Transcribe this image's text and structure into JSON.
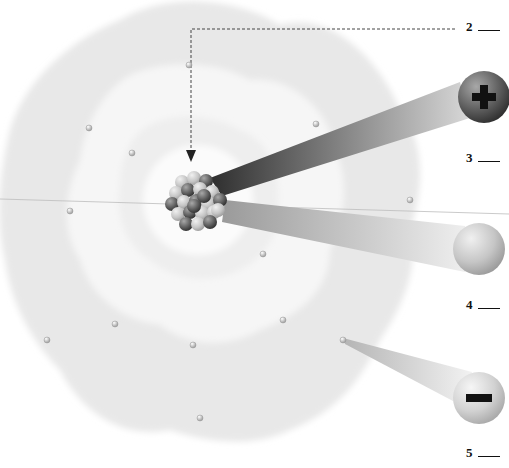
{
  "diagram": {
    "type": "atom-structure",
    "labels": [
      {
        "id": "2",
        "text": "2",
        "blank": "___",
        "target": "nucleus",
        "x": 469,
        "y": 22
      },
      {
        "id": "3",
        "text": "3",
        "blank": "___",
        "target": "proton",
        "x": 469,
        "y": 152
      },
      {
        "id": "4",
        "text": "4",
        "blank": "___",
        "target": "neutron",
        "x": 469,
        "y": 299
      },
      {
        "id": "5",
        "text": "5",
        "blank": "___",
        "target": "electron",
        "x": 469,
        "y": 448
      }
    ],
    "particles": {
      "proton": {
        "symbol": "+",
        "color": "#5a5a5a"
      },
      "neutron": {
        "symbol": "",
        "color": "#c4c4c4"
      },
      "electron": {
        "symbol": "−",
        "color": "#d0d0d0"
      }
    },
    "electrons": [
      {
        "x": 189,
        "y": 65
      },
      {
        "x": 89,
        "y": 128
      },
      {
        "x": 132,
        "y": 153
      },
      {
        "x": 316,
        "y": 124
      },
      {
        "x": 410,
        "y": 200
      },
      {
        "x": 70,
        "y": 211
      },
      {
        "x": 263,
        "y": 254
      },
      {
        "x": 283,
        "y": 320
      },
      {
        "x": 115,
        "y": 324
      },
      {
        "x": 47,
        "y": 340
      },
      {
        "x": 193,
        "y": 345
      },
      {
        "x": 343,
        "y": 340
      },
      {
        "x": 200,
        "y": 418
      }
    ],
    "colors": {
      "background": "#ffffff",
      "cloud": "#e9e9e9",
      "text": "#111111",
      "leader_line": "#444444"
    }
  }
}
